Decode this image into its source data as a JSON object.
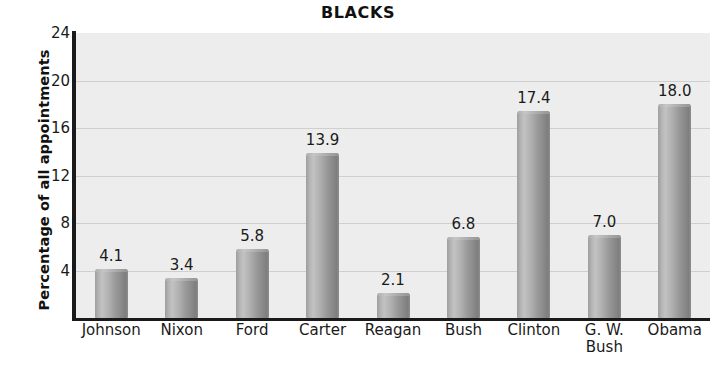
{
  "chart_data": {
    "type": "bar",
    "title": "BLACKS",
    "xlabel": "",
    "ylabel": "Percentage of all appointments",
    "categories": [
      "Johnson",
      "Nixon",
      "Ford",
      "Carter",
      "Reagan",
      "Bush",
      "Clinton",
      "G. W.\nBush",
      "Obama"
    ],
    "values": [
      4.1,
      3.4,
      5.8,
      13.9,
      2.1,
      6.8,
      17.4,
      7.0,
      18.0
    ],
    "value_labels": [
      "4.1",
      "3.4",
      "5.8",
      "13.9",
      "2.1",
      "6.8",
      "17.4",
      "7.0",
      "18.0"
    ],
    "ylim": [
      0,
      24
    ],
    "yticks": [
      4,
      8,
      12,
      16,
      20,
      24
    ],
    "ytick_labels": [
      "4",
      "8",
      "12",
      "16",
      "20",
      "24"
    ],
    "grid": true,
    "legend": null,
    "legend_position": "none",
    "colors": {
      "plot_background": "#ededed",
      "bar_fill": "#a6a6a6",
      "gridline": "#cfcfcf",
      "axis": "#1a1a1a",
      "text": "#1a1a1a",
      "page_background": "#ffffff"
    }
  }
}
